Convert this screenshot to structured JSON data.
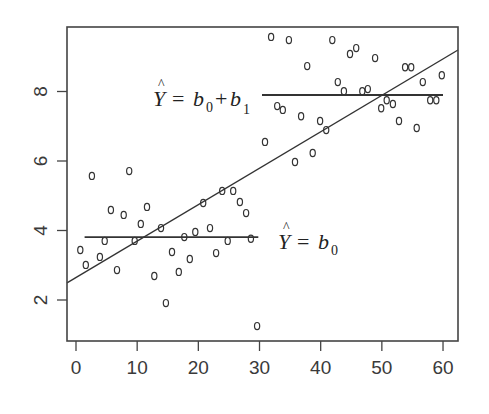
{
  "chart_data": {
    "type": "scatter",
    "title": "",
    "xlabel": "",
    "ylabel": "",
    "xlim": [
      -1.5,
      62.5
    ],
    "ylim": [
      0.8,
      9.85
    ],
    "grid": false,
    "legend": null,
    "x_ticks": [
      0,
      10,
      20,
      30,
      40,
      50,
      60
    ],
    "y_ticks": [
      2,
      4,
      6,
      8
    ],
    "x_tick_labels": [
      "0",
      "10",
      "20",
      "30",
      "40",
      "50",
      "60"
    ],
    "y_tick_labels": [
      "2",
      "4",
      "6",
      "8"
    ],
    "marker": "o",
    "series": [
      {
        "name": "group_0 (x < 30)",
        "points": [
          [
            0.7,
            3.44
          ],
          [
            1.6,
            3.01
          ],
          [
            2.6,
            5.57
          ],
          [
            3.9,
            3.24
          ],
          [
            4.7,
            3.7
          ],
          [
            5.7,
            4.59
          ],
          [
            6.7,
            2.86
          ],
          [
            7.8,
            4.45
          ],
          [
            8.7,
            5.71
          ],
          [
            9.6,
            3.7
          ],
          [
            10.6,
            4.19
          ],
          [
            11.6,
            4.68
          ],
          [
            12.8,
            2.69
          ],
          [
            13.9,
            4.07
          ],
          [
            14.7,
            1.91
          ],
          [
            15.7,
            3.38
          ],
          [
            16.8,
            2.81
          ],
          [
            17.7,
            3.81
          ],
          [
            18.6,
            3.18
          ],
          [
            19.5,
            3.96
          ],
          [
            20.8,
            4.79
          ],
          [
            21.9,
            4.07
          ],
          [
            22.9,
            3.35
          ],
          [
            23.9,
            5.14
          ],
          [
            24.8,
            3.7
          ],
          [
            25.7,
            5.14
          ],
          [
            26.8,
            4.82
          ],
          [
            27.8,
            4.5
          ],
          [
            28.6,
            3.76
          ],
          [
            29.6,
            1.25
          ]
        ]
      },
      {
        "name": "group_1 (x >= 30)",
        "points": [
          [
            30.9,
            6.55
          ],
          [
            31.9,
            9.57
          ],
          [
            32.9,
            7.58
          ],
          [
            33.8,
            7.47
          ],
          [
            34.8,
            9.48
          ],
          [
            35.8,
            5.97
          ],
          [
            36.8,
            7.29
          ],
          [
            37.8,
            8.73
          ],
          [
            38.7,
            6.23
          ],
          [
            39.9,
            7.15
          ],
          [
            40.9,
            6.89
          ],
          [
            41.9,
            9.48
          ],
          [
            42.8,
            8.27
          ],
          [
            43.8,
            8.01
          ],
          [
            44.8,
            9.08
          ],
          [
            45.8,
            9.25
          ],
          [
            46.8,
            8.01
          ],
          [
            47.7,
            8.07
          ],
          [
            48.9,
            8.96
          ],
          [
            49.9,
            7.52
          ],
          [
            50.8,
            7.75
          ],
          [
            51.8,
            7.64
          ],
          [
            52.8,
            7.15
          ],
          [
            53.8,
            8.7
          ],
          [
            54.8,
            8.7
          ],
          [
            55.7,
            6.95
          ],
          [
            56.7,
            8.27
          ],
          [
            57.9,
            7.75
          ],
          [
            58.9,
            7.75
          ],
          [
            59.8,
            8.47
          ]
        ]
      }
    ],
    "lines": [
      {
        "name": "overall regression",
        "type": "abline",
        "intercept": 2.65,
        "slope": 0.1048
      },
      {
        "name": "mean group 0",
        "type": "segment",
        "x": [
          1.4,
          29.8
        ],
        "y": [
          3.81,
          3.81
        ]
      },
      {
        "name": "mean group 1",
        "type": "segment",
        "x": [
          30.4,
          60.0
        ],
        "y": [
          7.9,
          7.9
        ]
      }
    ],
    "annotations": [
      {
        "text": "Ŷ = b0 + b1",
        "x": 13.0,
        "y": 7.9
      },
      {
        "text": "Ŷ = b0",
        "x": 31.0,
        "y": 3.81
      }
    ]
  },
  "labels": {
    "upper_formula": {
      "Y": "Y",
      "hat": "^",
      "eq": "=",
      "b": "b",
      "sub0": "0",
      "plus": "+",
      "b1": "b",
      "sub1": "1"
    },
    "lower_formula": {
      "Y": "Y",
      "hat": "^",
      "eq": "=",
      "b": "b",
      "sub0": "0"
    }
  },
  "style": {
    "frame_color": "#444444",
    "line_color": "#333333",
    "point_color": "#333333",
    "background": "#ffffff"
  }
}
